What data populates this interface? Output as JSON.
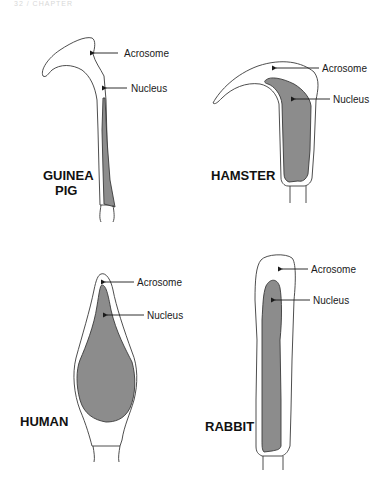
{
  "header": {
    "text": "32 / CHAPTER"
  },
  "colors": {
    "nucleus": "#8c8c8c",
    "outline": "#3a3a3a",
    "text": "#111111"
  },
  "panels": [
    {
      "species": "GUINEA",
      "species_line2": "PIG",
      "labels": {
        "acrosome": "Acrosome",
        "nucleus": "Nucleus"
      }
    },
    {
      "species": "HAMSTER",
      "labels": {
        "acrosome": "Acrosome",
        "nucleus": "Nucleus"
      }
    },
    {
      "species": "HUMAN",
      "labels": {
        "acrosome": "Acrosome",
        "nucleus": "Nucleus"
      }
    },
    {
      "species": "RABBIT",
      "labels": {
        "acrosome": "Acrosome",
        "nucleus": "Nucleus"
      }
    }
  ]
}
